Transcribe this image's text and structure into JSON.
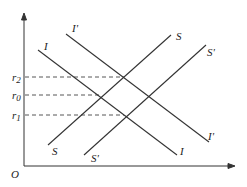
{
  "diagram": {
    "origin_label": "O",
    "y_ticks": [
      {
        "label": "r",
        "sub": "2",
        "y": 77
      },
      {
        "label": "r",
        "sub": "0",
        "y": 95
      },
      {
        "label": "r",
        "sub": "1",
        "y": 115
      }
    ],
    "curves": [
      {
        "name": "I",
        "label_top": "I",
        "label_bottom": "I"
      },
      {
        "name": "I'",
        "label_top": "I'",
        "label_bottom": "I'"
      },
      {
        "name": "S",
        "label_top": "S",
        "label_bottom": "S"
      },
      {
        "name": "S'",
        "label_top": "S'",
        "label_bottom": "S'"
      }
    ],
    "colors": {
      "line": "#333333",
      "dash": "#444444"
    }
  }
}
